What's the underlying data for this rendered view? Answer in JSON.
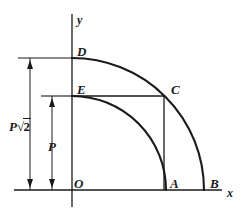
{
  "figure": {
    "type": "geometry-diagram",
    "background_color": "#ffffff",
    "stroke_color": "#1a1a1a",
    "axes": {
      "x_label": "x",
      "y_label": "y",
      "origin_label": "O"
    },
    "points": [
      {
        "id": "O",
        "label": "O",
        "x": 72,
        "y": 190,
        "desc": "origin"
      },
      {
        "id": "A",
        "label": "A",
        "x": 163,
        "y": 190,
        "desc": "inner arc meets x-axis"
      },
      {
        "id": "B",
        "label": "B",
        "x": 203,
        "y": 190,
        "desc": "outer arc meets x-axis"
      },
      {
        "id": "C",
        "label": "C",
        "x": 163,
        "y": 96,
        "desc": "outer arc meets vertical through A"
      },
      {
        "id": "D",
        "label": "D",
        "x": 72,
        "y": 58,
        "desc": "outer arc meets y-axis"
      },
      {
        "id": "E",
        "label": "E",
        "x": 72,
        "y": 96,
        "desc": "inner arc meets y-axis"
      }
    ],
    "arcs": [
      {
        "id": "inner-arc",
        "from": "E",
        "to": "A",
        "radius_label": "P"
      },
      {
        "id": "outer-arc",
        "from": "D",
        "to": "B",
        "radius_label": "P√2"
      }
    ],
    "dimensions": [
      {
        "id": "outer-dimension",
        "label_text": "P",
        "label_radical": "2",
        "label_plain": "P√2",
        "from": "O",
        "to": "D"
      },
      {
        "id": "inner-dimension",
        "label_text": "P",
        "label_radical": "",
        "label_plain": "P",
        "from": "O",
        "to": "E"
      }
    ],
    "guide_lines": [
      {
        "id": "segment-e-c",
        "desc": "horizontal segment from E to C"
      },
      {
        "id": "segment-a-c",
        "desc": "vertical segment from A to C"
      }
    ]
  }
}
